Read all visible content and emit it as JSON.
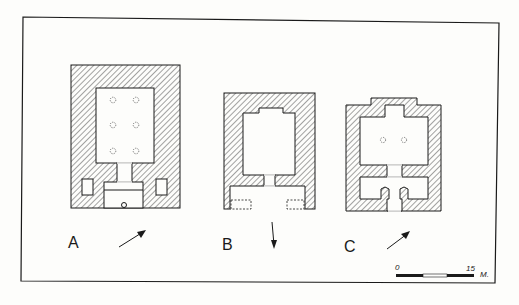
{
  "figure": {
    "type": "architectural-plan-comparison",
    "plans": [
      {
        "id": "A",
        "label": "A",
        "north_arrow": "north-east",
        "columns": 6
      },
      {
        "id": "B",
        "label": "B",
        "north_arrow": "south",
        "columns": 0
      },
      {
        "id": "C",
        "label": "C",
        "north_arrow": "north-east",
        "columns": 2
      }
    ],
    "scale_bar": {
      "start_label": "0",
      "end_label": "15",
      "unit_label": "M."
    },
    "colors": {
      "ink": "#1a1a1a",
      "paper": "#fdfdfb"
    }
  }
}
